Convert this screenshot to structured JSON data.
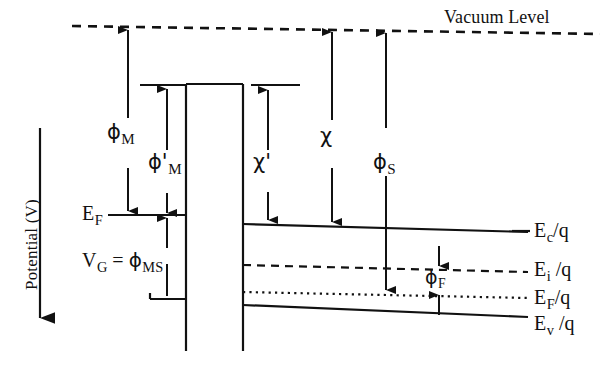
{
  "figure": {
    "type": "energy-band-diagram",
    "background_color": "#ffffff",
    "line_color": "#111111"
  },
  "axis": {
    "label": "Potential (V)",
    "direction": "downward-arrow"
  },
  "vacuum": {
    "label": "Vacuum Level",
    "line_style": "dashed"
  },
  "metal": {
    "fermi_label_main": "E",
    "fermi_label_sub": "F",
    "gate_label_main": "V",
    "gate_label_sub": "G",
    "gate_label_eq": " = ",
    "gate_label_phi": "ϕ",
    "gate_label_phi_sub": "MS"
  },
  "arrows": [
    {
      "name": "phi-M",
      "symbol": "ϕ",
      "subscript": "M",
      "description": "metal work function, vacuum level to metal Fermi level"
    },
    {
      "name": "phi-M-prime",
      "symbol": "ϕ'",
      "subscript": "M",
      "description": "modified metal work function, oxide conduction band edge to metal Fermi level"
    },
    {
      "name": "chi-prime",
      "symbol": "χ'",
      "subscript": "",
      "description": "modified electron affinity, oxide conduction band edge to semiconductor conduction band edge"
    },
    {
      "name": "chi",
      "symbol": "χ",
      "subscript": "",
      "description": "semiconductor electron affinity, vacuum level to semiconductor conduction band edge"
    },
    {
      "name": "phi-S",
      "symbol": "ϕ",
      "subscript": "S",
      "description": "semiconductor work function, vacuum level to semiconductor Fermi level"
    },
    {
      "name": "phi-F",
      "symbol": "ϕ",
      "subscript": "F",
      "description": "bulk potential, intrinsic level to semiconductor Fermi level"
    }
  ],
  "semiconductor_levels": [
    {
      "name": "Ec",
      "main": "E",
      "sub": "c",
      "tail": "/q",
      "style": "solid"
    },
    {
      "name": "Ei",
      "main": "E",
      "sub": "i",
      "tail": " /q",
      "style": "dashed"
    },
    {
      "name": "EF",
      "main": "E",
      "sub": "F",
      "tail": "/q",
      "style": "dotted"
    },
    {
      "name": "Ev",
      "main": "E",
      "sub": "v",
      "tail": " /q",
      "style": "solid"
    }
  ]
}
